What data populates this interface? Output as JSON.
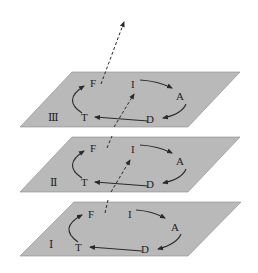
{
  "diagram": {
    "type": "stacked-planes-cycle",
    "colors": {
      "plane_fill": "#b9b9b9",
      "line": "#2a2a2a",
      "background": "#ffffff"
    },
    "planes": [
      {
        "id": "III",
        "roman_label": "Ⅲ",
        "nodes": {
          "F": "F",
          "I": "I",
          "A": "A",
          "D": "D",
          "T": "T"
        }
      },
      {
        "id": "II",
        "roman_label": "Ⅱ",
        "nodes": {
          "F": "F",
          "I": "I",
          "A": "A",
          "D": "D",
          "T": "T"
        }
      },
      {
        "id": "I",
        "roman_label": "Ⅰ",
        "nodes": {
          "F": "F",
          "I": "I",
          "A": "A",
          "D": "D",
          "T": "T"
        }
      }
    ],
    "cycle_order": [
      "I",
      "A",
      "D",
      "T",
      "F"
    ],
    "cross_plane_arrows": [
      {
        "from": "I.F",
        "to": "II.I",
        "style": "dashed"
      },
      {
        "from": "II.F",
        "to": "III.I",
        "style": "dashed"
      },
      {
        "from": "III.F",
        "to": "up",
        "style": "dashed"
      }
    ]
  }
}
